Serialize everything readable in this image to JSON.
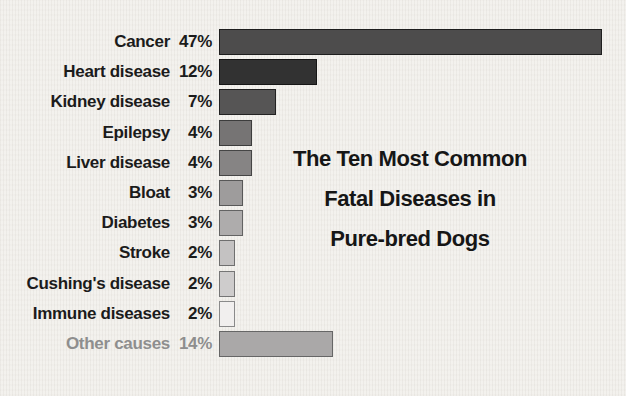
{
  "chart_data": {
    "type": "bar",
    "orientation": "horizontal",
    "title": "The Ten Most Common Fatal Diseases in Pure-bred Dogs",
    "title_lines": [
      "The Ten Most Common",
      "Fatal Diseases in",
      "Pure-bred Dogs"
    ],
    "unit": "percent",
    "axes_shown": false,
    "legend_shown": false,
    "xlim": [
      0,
      47
    ],
    "categories": [
      "Cancer",
      "Heart disease",
      "Kidney disease",
      "Epilepsy",
      "Liver disease",
      "Bloat",
      "Diabetes",
      "Stroke",
      "Cushing's disease",
      "Immune diseases",
      "Other causes"
    ],
    "values": [
      47,
      12,
      7,
      4,
      4,
      3,
      3,
      2,
      2,
      2,
      14
    ],
    "value_labels": [
      "47%",
      "12%",
      "7%",
      "4%",
      "4%",
      "3%",
      "3%",
      "2%",
      "2%",
      "2%",
      "14%"
    ],
    "bar_fill_colors": [
      "#4d4c4c",
      "#323232",
      "#565555",
      "#767474",
      "#868484",
      "#9e9c9c",
      "#aeacac",
      "#c4c2c2",
      "#cecccc",
      "#f1efee",
      "#aaa8a8"
    ],
    "bar_border_colors": [
      "#1e1e1e",
      "#161616",
      "#222222",
      "#3c3c3c",
      "#454545",
      "#585858",
      "#636363",
      "#6f6f6f",
      "#757575",
      "#8a8a8a",
      "#666666"
    ],
    "category_label_colors": [
      "#1b1b1b",
      "#1b1b1b",
      "#1b1b1b",
      "#1b1b1b",
      "#1b1b1b",
      "#1b1b1b",
      "#1b1b1b",
      "#1b1b1b",
      "#1b1b1b",
      "#1b1b1b",
      "#8e8e8e"
    ]
  },
  "style": {
    "background_color": "#f3f1ed",
    "label_text_color": "#1b1b1b",
    "muted_text_color": "#8e8e8e",
    "title_text_color": "#161616"
  }
}
